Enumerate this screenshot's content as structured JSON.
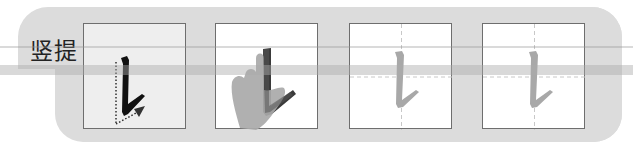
{
  "stroke": {
    "name": "竖提",
    "steps": [
      {
        "id": "stroke-demo",
        "description": "black stroke with dotted direction arrow"
      },
      {
        "id": "finger-trace",
        "description": "hand tracing the stroke"
      },
      {
        "id": "practice-grid-1",
        "description": "gray stroke on dashed cross grid"
      },
      {
        "id": "practice-grid-2",
        "description": "gray stroke on dashed cross grid"
      }
    ]
  },
  "colors": {
    "panel": "#dcdcdc",
    "box_border": "#6e6e6e",
    "stroke_dark": "#111111",
    "stroke_gray": "#a8a8a8",
    "hand": "#a9a9a9",
    "grid_dash": "#c8c8c8"
  }
}
